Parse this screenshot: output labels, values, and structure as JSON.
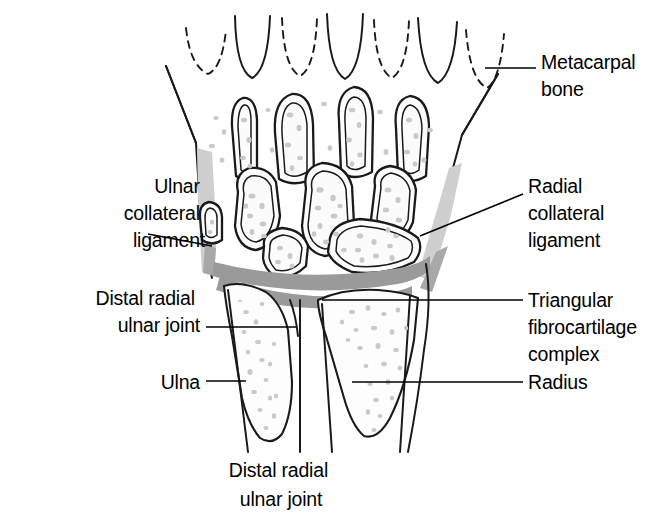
{
  "figure": {
    "caption": "Distal radial\nulnar joint",
    "caption_line1": "Distal radial",
    "caption_line2": "ulnar joint",
    "background_color": "#ffffff",
    "ink_color": "#1a1a1a",
    "tfcc_color": "#9a9a9a",
    "ligament_color": "#cfcfcf",
    "trabecular_color": "#c9c9c9"
  },
  "labels": [
    {
      "id": "metacarpal-bone",
      "lines": [
        "Metacarpal",
        "bone"
      ],
      "line1": "Metacarpal",
      "line2": "bone",
      "align": "left",
      "x": 541,
      "y": 62,
      "leader_from": [
        485,
        68
      ],
      "leader_to": [
        536,
        68
      ]
    },
    {
      "id": "ulnar-collateral-ligament",
      "lines": [
        "Ulnar",
        "collateral",
        "ligament"
      ],
      "line1": "Ulnar",
      "line2": "collateral",
      "line3": "ligament",
      "align": "right",
      "x": 205,
      "y": 186,
      "leader_from": [
        212,
        246
      ],
      "leader_to": [
        148,
        234
      ]
    },
    {
      "id": "radial-collateral-ligament",
      "lines": [
        "Radial",
        "collateral",
        "ligament"
      ],
      "line1": "Radial",
      "line2": "collateral",
      "line3": "ligament",
      "align": "left",
      "x": 528,
      "y": 186,
      "leader_from": [
        420,
        236
      ],
      "leader_to": [
        523,
        194
      ]
    },
    {
      "id": "distal-radial-ulnar-joint",
      "lines": [
        "Distal radial",
        "ulnar joint"
      ],
      "line1": "Distal radial",
      "line2": "ulnar joint",
      "align": "right",
      "x": 200,
      "y": 305,
      "leader_from": [
        296,
        327
      ],
      "leader_to": [
        206,
        327
      ]
    },
    {
      "id": "triangular-fibrocartilage-complex",
      "lines": [
        "Triangular",
        "fibrocartilage",
        "complex"
      ],
      "line1": "Triangular",
      "line2": "fibrocartilage",
      "line3": "complex",
      "align": "left",
      "x": 528,
      "y": 305,
      "leader_from": [
        322,
        300
      ],
      "leader_to": [
        523,
        300
      ]
    },
    {
      "id": "ulna",
      "lines": [
        "Ulna"
      ],
      "line1": "Ulna",
      "align": "right",
      "x": 200,
      "y": 388,
      "leader_from": [
        246,
        381
      ],
      "leader_to": [
        206,
        381
      ]
    },
    {
      "id": "radius",
      "lines": [
        "Radius"
      ],
      "line1": "Radius",
      "align": "left",
      "x": 528,
      "y": 388,
      "leader_from": [
        352,
        382
      ],
      "leader_to": [
        523,
        382
      ]
    }
  ]
}
